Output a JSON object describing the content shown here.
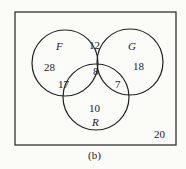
{
  "diagram": {
    "type": "venn",
    "sets": [
      {
        "name": "F",
        "label": "F"
      },
      {
        "name": "G",
        "label": "G"
      },
      {
        "name": "R",
        "label": "R"
      }
    ],
    "regions": {
      "F_only": "28",
      "G_only": "18",
      "R_only": "10",
      "F_G_only": "12",
      "F_R_only": "17",
      "G_R_only": "7",
      "F_G_R": "8",
      "outside": "20"
    },
    "caption": "(b)"
  }
}
